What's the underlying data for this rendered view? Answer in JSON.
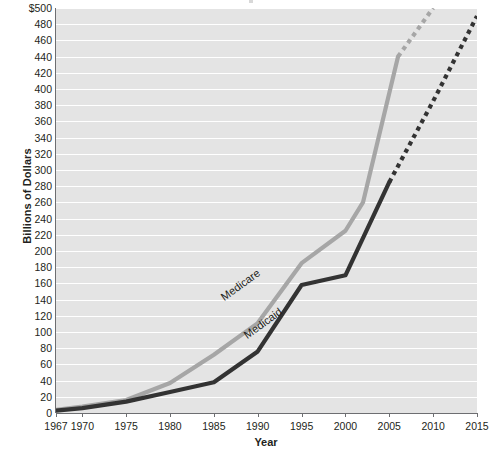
{
  "chart_data": {
    "type": "line",
    "title": "",
    "xlabel": "Year",
    "ylabel": "Billions of Dollars",
    "xlim": [
      1967,
      2015
    ],
    "ylim": [
      0,
      500
    ],
    "ytick_step": 20,
    "grid": true,
    "legend": "inline-labels",
    "x_ticks": [
      "1967",
      "1970",
      "1975",
      "1980",
      "1985",
      "1990",
      "1995",
      "2000",
      "2005",
      "2010",
      "2015"
    ],
    "x_tick_values": [
      1967,
      1970,
      1975,
      1980,
      1985,
      1990,
      1995,
      2000,
      2005,
      2010,
      2015
    ],
    "y_ticks": [
      "0",
      "20",
      "40",
      "60",
      "80",
      "100",
      "120",
      "140",
      "160",
      "180",
      "200",
      "220",
      "240",
      "260",
      "280",
      "300",
      "320",
      "340",
      "360",
      "380",
      "400",
      "420",
      "440",
      "460",
      "480",
      "$500"
    ],
    "y_tick_values": [
      0,
      20,
      40,
      60,
      80,
      100,
      120,
      140,
      160,
      180,
      200,
      220,
      240,
      260,
      280,
      300,
      320,
      340,
      360,
      380,
      400,
      420,
      440,
      460,
      480,
      500
    ],
    "series": [
      {
        "name": "Medicare",
        "color": "#a6a6a6",
        "label_text": "Medicare",
        "solid": {
          "x": [
            1967,
            1970,
            1975,
            1980,
            1985,
            1990,
            1995,
            2000,
            2002,
            2006
          ],
          "y": [
            4,
            8,
            16,
            37,
            72,
            111,
            185,
            225,
            260,
            440
          ]
        },
        "projected": {
          "x": [
            2006,
            2008,
            2010
          ],
          "y": [
            440,
            470,
            500
          ],
          "style": "dotted"
        }
      },
      {
        "name": "Medicaid",
        "color": "#333333",
        "label_text": "Medicaid",
        "solid": {
          "x": [
            1967,
            1970,
            1975,
            1980,
            1985,
            1990,
            1995,
            2000,
            2005
          ],
          "y": [
            3,
            6,
            14,
            26,
            38,
            76,
            158,
            170,
            285
          ]
        },
        "projected": {
          "x": [
            2005,
            2010,
            2015
          ],
          "y": [
            285,
            385,
            490
          ],
          "style": "dotted"
        }
      }
    ]
  },
  "axes": {
    "y_title": "Billions of Dollars",
    "x_title": "Year"
  }
}
